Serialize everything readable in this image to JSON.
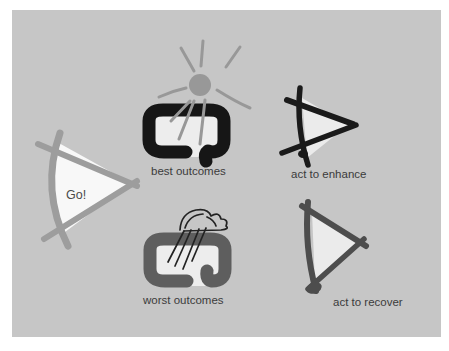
{
  "figure": {
    "labels": {
      "go": "Go!",
      "best": "best outcomes",
      "worst": "worst outcomes",
      "enhance": "act to enhance",
      "recover": "act to recover"
    },
    "icons": {
      "go": "go-triangle-icon",
      "best": "open-loop-frame-icon",
      "best_weather": "sun-icon",
      "worst": "open-loop-frame-icon",
      "worst_weather": "rain-cloud-icon",
      "enhance": "triangle-outline-icon",
      "recover": "triangle-outline-icon"
    },
    "colors": {
      "page_bg": "#ffffff",
      "panel_bg": "#c6c6c6",
      "go_stroke": "#9d9d9d",
      "go_fill": "#f8f8f8",
      "go_label_color": "#4a4a4a",
      "sun": "#989898",
      "inner_fill": "#ededed",
      "best_frame": "#161616",
      "worst_frame": "#5e5e5e",
      "cloud_stroke": "#222222",
      "tri_fill": "#ebebeb",
      "enhance_stroke": "#1a1a1a",
      "recover_stroke": "#4d4d4d",
      "label_color": "#3b3b3b"
    }
  }
}
